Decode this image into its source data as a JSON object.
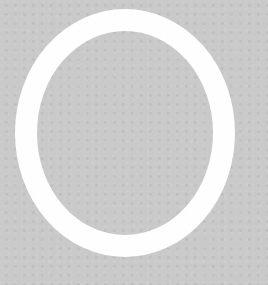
{
  "image": {
    "description": "Large white letter O on gray textured background",
    "letter": "O",
    "colors": {
      "background": "#c9c9c9",
      "letter": "#ffffff"
    },
    "shape": {
      "cx": 125,
      "cy": 133,
      "rx": 99,
      "ry": 113,
      "stroke_width": 22
    }
  }
}
